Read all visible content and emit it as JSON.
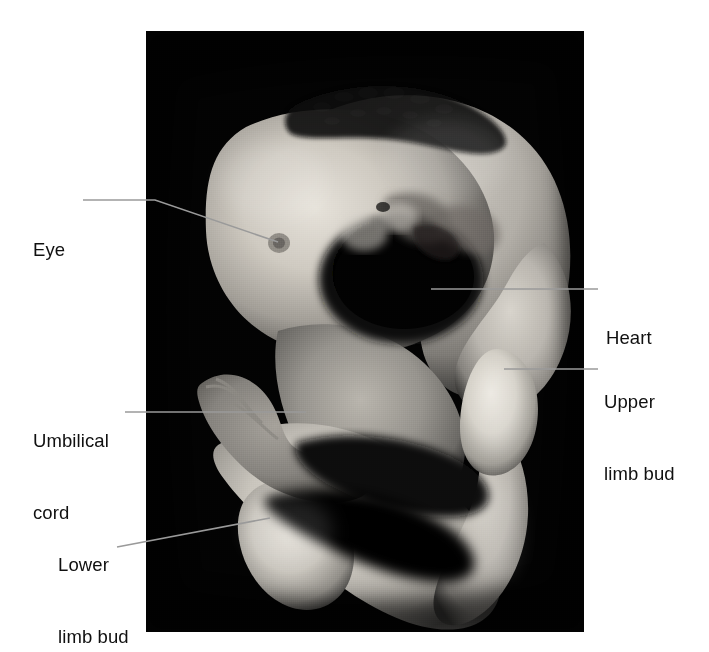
{
  "figure": {
    "type": "labeled-anatomical-photograph",
    "background_color": "#ffffff",
    "plate_color": "#030303",
    "label_text_color": "#101010",
    "leader_line_color": "#9a9a9a"
  },
  "plate": {
    "left": 146,
    "top": 31,
    "width": 438,
    "height": 601
  },
  "labels": [
    {
      "id": "eye",
      "name": "Eye",
      "lines": [
        "Eye"
      ],
      "side": "left",
      "text_x": 33,
      "text_y": 190,
      "leader": [
        [
          83,
          200
        ],
        [
          155,
          200
        ],
        [
          278,
          242
        ]
      ]
    },
    {
      "id": "heart",
      "name": "Heart",
      "lines": [
        "Heart"
      ],
      "side": "right",
      "text_x": 606,
      "text_y": 278,
      "leader": [
        [
          598,
          289
        ],
        [
          431,
          289
        ]
      ]
    },
    {
      "id": "upper-limb-bud",
      "name": "Upper limb bud",
      "lines": [
        "Upper",
        "limb bud"
      ],
      "side": "right",
      "text_x": 604,
      "text_y": 342,
      "leader": [
        [
          598,
          369
        ],
        [
          504,
          369
        ]
      ]
    },
    {
      "id": "umbilical-cord",
      "name": "Umbilical cord",
      "lines": [
        "Umbilical",
        "cord"
      ],
      "side": "left",
      "text_x": 33,
      "text_y": 381,
      "leader": [
        [
          125,
          412
        ],
        [
          306,
          412
        ]
      ]
    },
    {
      "id": "lower-limb-bud",
      "name": "Lower limb bud",
      "lines": [
        "Lower",
        "limb bud"
      ],
      "side": "left",
      "text_x": 58,
      "text_y": 505,
      "leader": [
        [
          117,
          547
        ],
        [
          270,
          518
        ]
      ]
    }
  ]
}
